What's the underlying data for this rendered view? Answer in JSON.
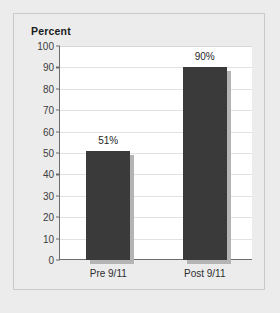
{
  "chart_data": {
    "type": "bar",
    "title": "Percent",
    "xlabel": "",
    "ylabel": "Percent",
    "categories": [
      "Pre 9/11",
      "Post 9/11"
    ],
    "values": [
      51,
      90
    ],
    "data_labels": [
      "51%",
      "90%"
    ],
    "ylim": [
      0,
      100
    ],
    "ytick_step": 10,
    "yticks": [
      100,
      90,
      80,
      70,
      60,
      50,
      40,
      30,
      20,
      10,
      0
    ],
    "ytick_labels": [
      "100",
      "90",
      "80",
      "70",
      "60",
      "50",
      "40",
      "30",
      "20",
      "10",
      "0"
    ],
    "grid": true,
    "legend": false,
    "legend_position": "none",
    "series": [
      {
        "name": "Percent",
        "values": [
          51,
          90
        ]
      }
    ]
  },
  "colors": {
    "bar": "#3a3a3a",
    "bar_shadow": "#b4b4b4",
    "panel_background": "#ffffff",
    "figure_background": "#ececec",
    "gridline": "#e2e2e2",
    "axis": "#6d6d6d",
    "border": "#c9c9c9",
    "title_text": "#1b1b1b",
    "tick_text": "#3d3d3d"
  }
}
